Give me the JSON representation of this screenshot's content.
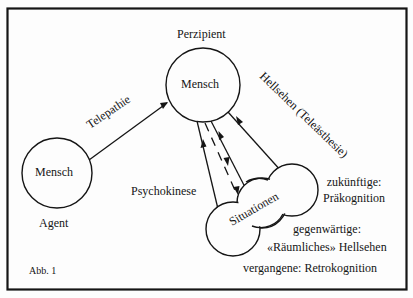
{
  "figure": {
    "caption": "Abb. 1",
    "colors": {
      "ink": "#151515",
      "paper": "#fdfdfd"
    }
  },
  "nodes": {
    "perzipient": {
      "role": "Perzipient",
      "label": "Mensch"
    },
    "agent": {
      "role": "Agent",
      "label": "Mensch"
    },
    "situations": {
      "label": "Situationen"
    }
  },
  "edges": {
    "telepathy": {
      "label": "Telepathie",
      "from": "Agent",
      "to": "Perzipient"
    },
    "clairvoyance": {
      "label": "Hellsehen (Teleästhesie)",
      "from": "Situationen",
      "to": "Perzipient"
    },
    "psychokinesis": {
      "label": "Psychokinese",
      "from": "Perzipient",
      "to": "Situationen"
    }
  },
  "situation_types": [
    {
      "time": "zukünftige:",
      "name": "Präkognition"
    },
    {
      "time": "gegenwärtige:",
      "name": "«Räumliches» Hellsehen"
    },
    {
      "time": "vergangene:",
      "name": "Retrokognition"
    }
  ],
  "retro_line": "vergangene: Retrokognition"
}
